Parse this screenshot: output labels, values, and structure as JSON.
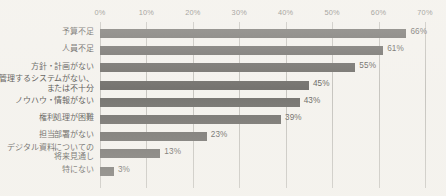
{
  "chart_data": {
    "type": "bar",
    "orientation": "horizontal",
    "title": "",
    "xlabel": "",
    "ylabel": "",
    "xlim": [
      0,
      70
    ],
    "xtick_labels": [
      "0%",
      "10%",
      "20%",
      "30%",
      "40%",
      "50%",
      "60%",
      "70%"
    ],
    "xticks": [
      0,
      10,
      20,
      30,
      40,
      50,
      60,
      70
    ],
    "grid": true,
    "legend": "none",
    "bar_color": "#4d4b48",
    "background_color": "#f6f4f0",
    "categories": [
      "予算不足",
      "人員不足",
      "方針・計画がない",
      "管理するシステムがない、\nまたは不十分",
      "ノウハウ・情報がない",
      "権利処理が困難",
      "担当部署がない",
      "デジタル資料についての\n将来見通し",
      "特にない"
    ],
    "values": [
      66,
      61,
      55,
      45,
      43,
      39,
      23,
      13,
      3
    ],
    "value_labels": [
      "66%",
      "61%",
      "55%",
      "45%",
      "43%",
      "39%",
      "23%",
      "13%",
      "3%"
    ]
  }
}
